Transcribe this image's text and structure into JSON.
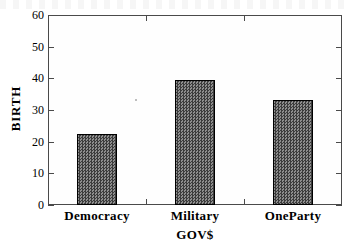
{
  "chart_data": {
    "type": "bar",
    "title": "",
    "xlabel": "GOV$",
    "ylabel": "BIRTH",
    "categories": [
      "Democracy",
      "Military",
      "OneParty"
    ],
    "values": [
      22.3,
      39.5,
      33.3
    ],
    "ylim": [
      0,
      60
    ],
    "yticks": [
      0,
      10,
      20,
      30,
      40,
      50,
      60
    ],
    "ytick_labels": [
      "0",
      "10",
      "20",
      "30",
      "40",
      "50",
      "60"
    ],
    "grid": false,
    "legend": null,
    "bar_fill_color": "#5a5a5a",
    "bar_edge_color": "#000000",
    "axis_color": "#4a4a4a",
    "background_color": "#ffffff"
  },
  "axes": {
    "y_title": "BIRTH",
    "x_title": "GOV$",
    "y_labels": [
      "60",
      "50",
      "40",
      "30",
      "20",
      "10",
      "0"
    ],
    "x_labels": [
      "Democracy",
      "Military",
      "OneParty"
    ]
  },
  "series": {
    "bars": [
      {
        "label": "Democracy",
        "value": 22.3
      },
      {
        "label": "Military",
        "value": 39.5
      },
      {
        "label": "OneParty",
        "value": 33.3
      }
    ]
  }
}
